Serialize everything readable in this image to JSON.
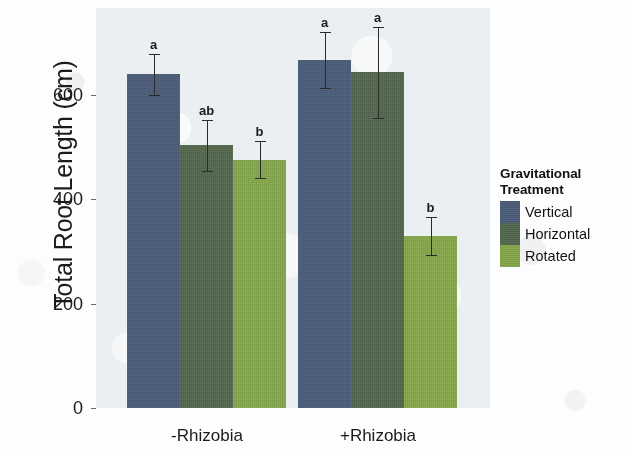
{
  "chart_data": {
    "type": "bar",
    "title": "",
    "xlabel": "",
    "ylabel": "Total Root Length (cm)",
    "categories": [
      "-Rhizobia",
      "+Rhizobia"
    ],
    "ylim": [
      0,
      700
    ],
    "yticks": [
      0,
      200,
      400,
      600
    ],
    "ytick_labels": [
      "0",
      "200",
      "400",
      "600"
    ],
    "grid": false,
    "legend_position": "right",
    "legend_title": "Gravitational Treatment",
    "series": [
      {
        "name": "Vertical",
        "color": "#4c5d78",
        "values": [
          640,
          667
        ],
        "err_low": [
          600,
          613
        ],
        "err_high": [
          678,
          720
        ],
        "sig_letters": [
          "a",
          "a"
        ]
      },
      {
        "name": "Horizontal",
        "color": "#54674f",
        "values": [
          504,
          644
        ],
        "err_low": [
          455,
          556
        ],
        "err_high": [
          553,
          730
        ],
        "sig_letters": [
          "ab",
          "a"
        ]
      },
      {
        "name": "Rotated",
        "color": "#82a44c",
        "values": [
          475,
          330
        ],
        "err_low": [
          440,
          293
        ],
        "err_high": [
          512,
          366
        ],
        "sig_letters": [
          "b",
          "b"
        ]
      }
    ]
  },
  "axis": {
    "y_title": "Total Root Length (cm)",
    "y_tick_0": "0",
    "y_tick_1": "200",
    "y_tick_2": "400",
    "y_tick_3": "600",
    "x_tick_0": "-Rhizobia",
    "x_tick_1": "+Rhizobia"
  },
  "legend": {
    "title_line1": "Gravitational",
    "title_line2": "Treatment",
    "items": [
      {
        "label": "Vertical",
        "color": "#4c5d78"
      },
      {
        "label": "Horizontal",
        "color": "#54674f"
      },
      {
        "label": "Rotated",
        "color": "#82a44c"
      }
    ]
  },
  "annotations": {
    "g1_vertical": "a",
    "g1_horizontal": "ab",
    "g1_rotated": "b",
    "g2_vertical": "a",
    "g2_horizontal": "a",
    "g2_rotated": "b"
  }
}
